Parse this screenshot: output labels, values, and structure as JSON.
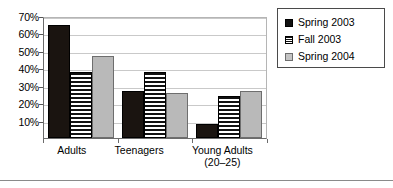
{
  "chart_data": {
    "type": "bar",
    "title": "",
    "subtitle": "",
    "xlabel": "",
    "ylabel": "",
    "categories": [
      "Adults",
      "Teenagers",
      "Young Adults"
    ],
    "category_sublabels": [
      "",
      "",
      "(20–25)"
    ],
    "series": [
      {
        "name": "Spring 2003",
        "values": [
          65,
          27,
          8
        ],
        "style": "solid-black",
        "color": "#1a1410"
      },
      {
        "name": "Fall 2003",
        "values": [
          38,
          38,
          24
        ],
        "style": "horizontal-stripes",
        "color": "#111111"
      },
      {
        "name": "Spring 2004",
        "values": [
          47,
          26,
          27
        ],
        "style": "solid-gray",
        "color": "#b9b9b9"
      }
    ],
    "ylim": [
      0,
      70
    ],
    "ytick_values": [
      70,
      60,
      50,
      40,
      30,
      20,
      10
    ],
    "ytick_labels": [
      "70%",
      "60%",
      "50%",
      "40%",
      "30%",
      "20%",
      "10%"
    ],
    "grid": true,
    "grid_color": "#c9c9c9",
    "legend_position": "top-right",
    "legend_entries": [
      "Spring 2003",
      "Fall 2003",
      "Spring 2004"
    ]
  }
}
